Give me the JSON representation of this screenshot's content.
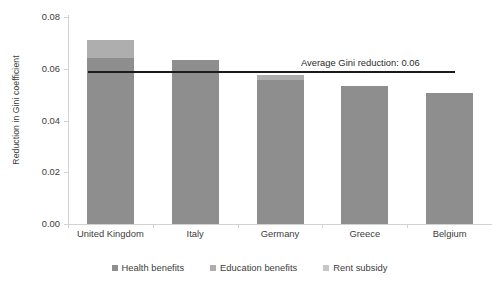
{
  "chart_data": {
    "type": "bar",
    "stacked": true,
    "title": "",
    "xlabel": "",
    "ylabel": "Reduction in Gini coefficient",
    "ylim": [
      0.0,
      0.08
    ],
    "ytick_labels": [
      "0.08",
      "0.06",
      "0.04",
      "0.02",
      "0.00"
    ],
    "ytick_values": [
      0.08,
      0.06,
      0.04,
      0.02,
      0.0
    ],
    "grid": false,
    "legend_position": "bottom",
    "categories": [
      "United Kingdom",
      "Italy",
      "Germany",
      "Greece",
      "Belgium"
    ],
    "series": [
      {
        "name": "Health benefits",
        "color": "#8e8e8e",
        "values": [
          0.064,
          0.0635,
          0.0555,
          0.0535,
          0.0505
        ]
      },
      {
        "name": "Education benefits",
        "color": "#aeaeae",
        "values": [
          0.007,
          0.0,
          0.002,
          0.0,
          0.0
        ]
      },
      {
        "name": "Rent subsidy",
        "color": "#c6c6c6",
        "values": [
          0.0,
          0.0,
          0.0,
          0.0,
          0.0
        ]
      }
    ],
    "totals": [
      0.071,
      0.0635,
      0.0575,
      0.0535,
      0.0505
    ],
    "annotations": [
      {
        "name": "average-line",
        "label": "Average Gini reduction: 0.06",
        "value": 0.06,
        "color": "#1a1a1a",
        "type": "horizontal-line"
      }
    ]
  },
  "legend": {
    "items": [
      {
        "label": "Health benefits",
        "color": "#8e8e8e"
      },
      {
        "label": "Education benefits",
        "color": "#aeaeae"
      },
      {
        "label": "Rent subsidy",
        "color": "#c6c6c6"
      }
    ]
  }
}
